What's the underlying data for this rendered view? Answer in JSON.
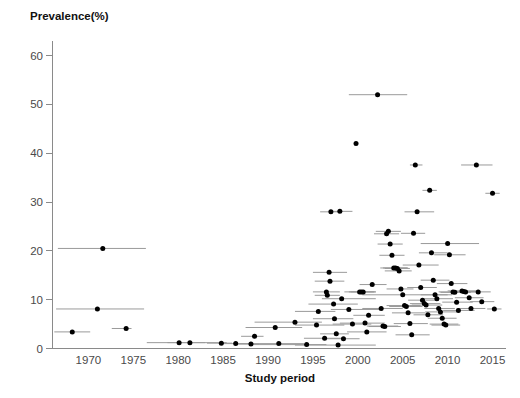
{
  "figure": {
    "ylabel": "Prevalence(%)",
    "xlabel": "Study period",
    "caption_fragment": ""
  },
  "chart_data": {
    "type": "scatter",
    "title": "",
    "subtitle": "",
    "xlabel": "Study period",
    "ylabel": "Prevalence(%)",
    "xlim": [
      1966,
      2016.5
    ],
    "ylim": [
      0,
      63
    ],
    "xticks": [
      1970,
      1975,
      1980,
      1985,
      1990,
      1995,
      2000,
      2005,
      2010,
      2015
    ],
    "yticks": [
      0,
      10,
      20,
      30,
      40,
      50,
      60
    ],
    "grid": false,
    "legend": null,
    "annotations": [],
    "marker": "filled-circle",
    "error_bar_orientation": "horizontal",
    "error_bar_meaning": "study period range",
    "series": [
      {
        "name": "Study prevalence estimates",
        "color": "#000000",
        "error_color": "#9a9a9a",
        "points": [
          {
            "x": 1968.2,
            "y": 3.4,
            "x_low": 1966.2,
            "x_high": 1970.2
          },
          {
            "x": 1971.0,
            "y": 8.1,
            "x_low": 1966.4,
            "x_high": 1976.2
          },
          {
            "x": 1971.6,
            "y": 20.5,
            "x_low": 1966.6,
            "x_high": 1976.4
          },
          {
            "x": 1974.2,
            "y": 4.1,
            "x_low": 1972.6,
            "x_high": 1974.8
          },
          {
            "x": 1980.1,
            "y": 1.2,
            "x_low": 1976.5,
            "x_high": 1983.0
          },
          {
            "x": 1981.3,
            "y": 1.2,
            "x_low": 1978.8,
            "x_high": 1985.4
          },
          {
            "x": 1984.8,
            "y": 1.1,
            "x_low": 1983.2,
            "x_high": 1986.0
          },
          {
            "x": 1986.4,
            "y": 1.0,
            "x_low": 1985.0,
            "x_high": 1988.2
          },
          {
            "x": 1988.1,
            "y": 0.9,
            "x_low": 1986.4,
            "x_high": 1989.0
          },
          {
            "x": 1988.5,
            "y": 2.5,
            "x_low": 1987.0,
            "x_high": 1989.5
          },
          {
            "x": 1990.8,
            "y": 4.3,
            "x_low": 1987.5,
            "x_high": 1993.8
          },
          {
            "x": 1991.2,
            "y": 1.0,
            "x_low": 1986.8,
            "x_high": 1994.0
          },
          {
            "x": 1993.0,
            "y": 5.4,
            "x_low": 1988.5,
            "x_high": 1996.0
          },
          {
            "x": 1994.3,
            "y": 0.8,
            "x_low": 1988.0,
            "x_high": 1996.5
          },
          {
            "x": 1995.4,
            "y": 4.8,
            "x_low": 1993.0,
            "x_high": 1998.5
          },
          {
            "x": 1995.6,
            "y": 7.6,
            "x_low": 1993.0,
            "x_high": 1997.5
          },
          {
            "x": 1996.3,
            "y": 2.1,
            "x_low": 1994.0,
            "x_high": 1998.2
          },
          {
            "x": 1996.5,
            "y": 11.6,
            "x_low": 1995.0,
            "x_high": 1998.0
          },
          {
            "x": 1996.6,
            "y": 10.9,
            "x_low": 1995.2,
            "x_high": 1998.0
          },
          {
            "x": 1996.8,
            "y": 15.6,
            "x_low": 1995.0,
            "x_high": 1998.8
          },
          {
            "x": 1996.9,
            "y": 13.8,
            "x_low": 1995.2,
            "x_high": 1998.5
          },
          {
            "x": 1997.0,
            "y": 28.0,
            "x_low": 1995.8,
            "x_high": 1998.2
          },
          {
            "x": 1997.3,
            "y": 9.1,
            "x_low": 1994.5,
            "x_high": 2000.0
          },
          {
            "x": 1997.4,
            "y": 6.1,
            "x_low": 1995.0,
            "x_high": 1999.5
          },
          {
            "x": 1997.6,
            "y": 3.0,
            "x_low": 1995.8,
            "x_high": 1999.0
          },
          {
            "x": 1997.8,
            "y": 0.7,
            "x_low": 1993.0,
            "x_high": 2002.0
          },
          {
            "x": 1998.0,
            "y": 28.1,
            "x_low": 1996.8,
            "x_high": 1999.4
          },
          {
            "x": 1998.2,
            "y": 10.2,
            "x_low": 1996.0,
            "x_high": 2002.0
          },
          {
            "x": 1998.4,
            "y": 2.0,
            "x_low": 1996.4,
            "x_high": 2000.2
          },
          {
            "x": 1999.0,
            "y": 8.0,
            "x_low": 1997.0,
            "x_high": 2002.5
          },
          {
            "x": 1999.4,
            "y": 5.0,
            "x_low": 1997.2,
            "x_high": 2001.5
          },
          {
            "x": 1999.8,
            "y": 42.0,
            "x_low": 1999.8,
            "x_high": 1999.8
          },
          {
            "x": 2000.2,
            "y": 11.6,
            "x_low": 1998.5,
            "x_high": 2002.0
          },
          {
            "x": 2000.4,
            "y": 11.6,
            "x_low": 1999.0,
            "x_high": 2001.8
          },
          {
            "x": 2000.6,
            "y": 11.6,
            "x_low": 1999.2,
            "x_high": 2002.0
          },
          {
            "x": 2000.8,
            "y": 5.2,
            "x_low": 1998.0,
            "x_high": 2003.0
          },
          {
            "x": 2001.0,
            "y": 3.4,
            "x_low": 1998.8,
            "x_high": 2003.2
          },
          {
            "x": 2001.2,
            "y": 6.8,
            "x_low": 1999.5,
            "x_high": 2003.0
          },
          {
            "x": 2001.6,
            "y": 13.1,
            "x_low": 2000.2,
            "x_high": 2003.2
          },
          {
            "x": 2002.2,
            "y": 52.0,
            "x_low": 1999.0,
            "x_high": 2005.5
          },
          {
            "x": 2002.6,
            "y": 8.2,
            "x_low": 2000.5,
            "x_high": 2005.0
          },
          {
            "x": 2002.8,
            "y": 4.6,
            "x_low": 2001.0,
            "x_high": 2004.5
          },
          {
            "x": 2003.0,
            "y": 4.5,
            "x_low": 2001.2,
            "x_high": 2004.8
          },
          {
            "x": 2003.2,
            "y": 23.5,
            "x_low": 2001.8,
            "x_high": 2004.6
          },
          {
            "x": 2003.4,
            "y": 24.0,
            "x_low": 2002.0,
            "x_high": 2004.8
          },
          {
            "x": 2003.6,
            "y": 21.4,
            "x_low": 2002.2,
            "x_high": 2005.0
          },
          {
            "x": 2003.8,
            "y": 19.1,
            "x_low": 2002.4,
            "x_high": 2005.2
          },
          {
            "x": 2004.0,
            "y": 16.5,
            "x_low": 2002.5,
            "x_high": 2005.5
          },
          {
            "x": 2004.2,
            "y": 16.5,
            "x_low": 2002.8,
            "x_high": 2005.6
          },
          {
            "x": 2004.4,
            "y": 16.4,
            "x_low": 2003.0,
            "x_high": 2005.8
          },
          {
            "x": 2004.6,
            "y": 15.9,
            "x_low": 2003.0,
            "x_high": 2006.0
          },
          {
            "x": 2004.8,
            "y": 12.2,
            "x_low": 2003.2,
            "x_high": 2006.2
          },
          {
            "x": 2005.0,
            "y": 11.0,
            "x_low": 2000.5,
            "x_high": 2010.0
          },
          {
            "x": 2005.2,
            "y": 8.8,
            "x_low": 2003.2,
            "x_high": 2007.0
          },
          {
            "x": 2005.4,
            "y": 8.6,
            "x_low": 2003.5,
            "x_high": 2007.2
          },
          {
            "x": 2005.6,
            "y": 7.3,
            "x_low": 2003.8,
            "x_high": 2007.5
          },
          {
            "x": 2005.8,
            "y": 5.1,
            "x_low": 2004.0,
            "x_high": 2007.8
          },
          {
            "x": 2006.0,
            "y": 2.8,
            "x_low": 2004.2,
            "x_high": 2008.0
          },
          {
            "x": 2006.2,
            "y": 23.6,
            "x_low": 2004.8,
            "x_high": 2007.5
          },
          {
            "x": 2006.4,
            "y": 37.6,
            "x_low": 2005.8,
            "x_high": 2007.2
          },
          {
            "x": 2006.6,
            "y": 28.0,
            "x_low": 2005.2,
            "x_high": 2008.5
          },
          {
            "x": 2006.8,
            "y": 17.1,
            "x_low": 2005.0,
            "x_high": 2009.0
          },
          {
            "x": 2007.0,
            "y": 12.5,
            "x_low": 2005.5,
            "x_high": 2008.8
          },
          {
            "x": 2007.2,
            "y": 9.9,
            "x_low": 2005.6,
            "x_high": 2009.0
          },
          {
            "x": 2007.4,
            "y": 9.2,
            "x_low": 2005.8,
            "x_high": 2009.2
          },
          {
            "x": 2007.6,
            "y": 8.9,
            "x_low": 2006.0,
            "x_high": 2009.4
          },
          {
            "x": 2007.8,
            "y": 6.9,
            "x_low": 2006.2,
            "x_high": 2009.5
          },
          {
            "x": 2008.0,
            "y": 32.4,
            "x_low": 2007.2,
            "x_high": 2008.8
          },
          {
            "x": 2008.2,
            "y": 19.6,
            "x_low": 2006.8,
            "x_high": 2010.0
          },
          {
            "x": 2008.4,
            "y": 14.0,
            "x_low": 2007.0,
            "x_high": 2010.2
          },
          {
            "x": 2008.6,
            "y": 11.0,
            "x_low": 2007.0,
            "x_high": 2010.5
          },
          {
            "x": 2008.8,
            "y": 10.2,
            "x_low": 2007.2,
            "x_high": 2010.6
          },
          {
            "x": 2009.0,
            "y": 8.2,
            "x_low": 2007.4,
            "x_high": 2010.8
          },
          {
            "x": 2009.2,
            "y": 7.5,
            "x_low": 2007.5,
            "x_high": 2011.0
          },
          {
            "x": 2009.4,
            "y": 6.2,
            "x_low": 2007.8,
            "x_high": 2011.0
          },
          {
            "x": 2009.6,
            "y": 5.0,
            "x_low": 2008.0,
            "x_high": 2011.2
          },
          {
            "x": 2009.8,
            "y": 4.8,
            "x_low": 2008.2,
            "x_high": 2011.4
          },
          {
            "x": 2010.0,
            "y": 21.5,
            "x_low": 2007.0,
            "x_high": 2013.5
          },
          {
            "x": 2010.2,
            "y": 19.2,
            "x_low": 2008.5,
            "x_high": 2012.0
          },
          {
            "x": 2010.4,
            "y": 13.3,
            "x_low": 2008.8,
            "x_high": 2012.2
          },
          {
            "x": 2010.6,
            "y": 11.6,
            "x_low": 2009.0,
            "x_high": 2012.5
          },
          {
            "x": 2010.8,
            "y": 11.5,
            "x_low": 2009.2,
            "x_high": 2012.6
          },
          {
            "x": 2011.0,
            "y": 9.5,
            "x_low": 2009.4,
            "x_high": 2012.8
          },
          {
            "x": 2011.2,
            "y": 7.8,
            "x_low": 2009.5,
            "x_high": 2013.0
          },
          {
            "x": 2011.6,
            "y": 11.8,
            "x_low": 2010.0,
            "x_high": 2013.2
          },
          {
            "x": 2011.8,
            "y": 11.7,
            "x_low": 2010.2,
            "x_high": 2013.4
          },
          {
            "x": 2012.0,
            "y": 11.6,
            "x_low": 2010.5,
            "x_high": 2013.6
          },
          {
            "x": 2012.4,
            "y": 10.4,
            "x_low": 2010.8,
            "x_high": 2014.0
          },
          {
            "x": 2012.6,
            "y": 8.2,
            "x_low": 2011.0,
            "x_high": 2014.2
          },
          {
            "x": 2013.2,
            "y": 37.6,
            "x_low": 2011.5,
            "x_high": 2015.0
          },
          {
            "x": 2013.4,
            "y": 11.6,
            "x_low": 2012.0,
            "x_high": 2014.8
          },
          {
            "x": 2013.8,
            "y": 9.6,
            "x_low": 2012.5,
            "x_high": 2015.2
          },
          {
            "x": 2015.0,
            "y": 31.8,
            "x_low": 2014.2,
            "x_high": 2015.8
          },
          {
            "x": 2015.2,
            "y": 8.1,
            "x_low": 2014.4,
            "x_high": 2016.0
          }
        ]
      }
    ]
  }
}
